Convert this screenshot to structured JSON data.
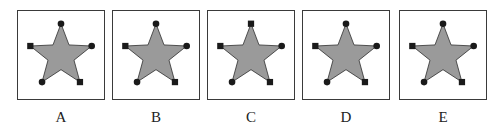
{
  "colors": {
    "star_fill": "#9a9a9a",
    "star_stroke": "#2a2a2a",
    "marker": "#1a1a1a",
    "border": "#3a3a3a"
  },
  "marker_order": [
    "top",
    "right",
    "lower-right",
    "lower-left",
    "left"
  ],
  "options": [
    {
      "label": "A",
      "left": 17,
      "markers": [
        "circle",
        "circle",
        "square",
        "circle",
        "square"
      ]
    },
    {
      "label": "B",
      "left": 112,
      "markers": [
        "circle",
        "circle",
        "square",
        "circle",
        "square"
      ]
    },
    {
      "label": "C",
      "left": 207,
      "markers": [
        "square",
        "circle",
        "square",
        "circle",
        "square"
      ]
    },
    {
      "label": "D",
      "left": 302,
      "markers": [
        "circle",
        "circle",
        "square",
        "circle",
        "square"
      ]
    },
    {
      "label": "E",
      "left": 399,
      "markers": [
        "circle",
        "circle",
        "square",
        "circle",
        "square"
      ]
    }
  ]
}
